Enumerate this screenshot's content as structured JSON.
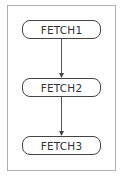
{
  "diagram": {
    "type": "flowchart",
    "nodes": [
      {
        "id": "n1",
        "label": "FETCH1"
      },
      {
        "id": "n2",
        "label": "FETCH2"
      },
      {
        "id": "n3",
        "label": "FETCH3"
      }
    ],
    "edges": [
      {
        "from": "n1",
        "to": "n2"
      },
      {
        "from": "n2",
        "to": "n3"
      }
    ],
    "colors": {
      "border": "#444444",
      "frame": "#b0b0b0",
      "text": "#333333"
    }
  }
}
